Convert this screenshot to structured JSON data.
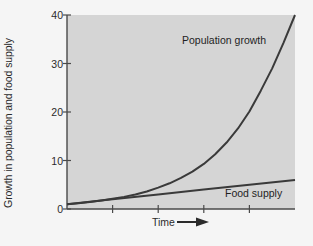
{
  "chart_data": {
    "type": "line",
    "title": "",
    "xlabel": "Time",
    "ylabel": "Growth in population and food supply",
    "xlabel_arrow": "➤",
    "ylim": [
      0,
      40
    ],
    "xlim": [
      0,
      5
    ],
    "yticks": [
      0,
      10,
      20,
      30,
      40
    ],
    "ytick_labels": [
      "0",
      "10",
      "20",
      "30",
      "40"
    ],
    "xticks": [
      1,
      2,
      3,
      4
    ],
    "xtick_labels": [
      "",
      "",
      "",
      ""
    ],
    "grid": false,
    "legend_position": "inline-annotations",
    "plot_background": "#d5d5d5",
    "figure_background": "#f5f5f5",
    "line_color": "#3a3a3a",
    "axis_color": "#4a4a4a",
    "series": [
      {
        "name": "Population growth",
        "annotation": "Population growth",
        "x": [
          0,
          0.25,
          0.5,
          0.75,
          1,
          1.25,
          1.5,
          1.75,
          2,
          2.25,
          2.5,
          2.75,
          3,
          3.25,
          3.5,
          3.75,
          4,
          4.25,
          4.5,
          4.75,
          5
        ],
        "values": [
          1.0,
          1.2,
          1.45,
          1.75,
          2.1,
          2.5,
          3.0,
          3.6,
          4.4,
          5.3,
          6.4,
          7.7,
          9.3,
          11.3,
          13.7,
          16.6,
          20.1,
          24.4,
          29.0,
          34.3,
          40.0
        ]
      },
      {
        "name": "Food supply",
        "annotation": "Food supply",
        "x": [
          0,
          1,
          2,
          3,
          4,
          5
        ],
        "values": [
          1.0,
          2.0,
          3.0,
          4.0,
          5.0,
          6.0
        ]
      }
    ],
    "annotations": [
      {
        "text": "Population growth",
        "x_px": 182,
        "y_px": 34
      },
      {
        "text": "Food supply",
        "x_px": 225,
        "y_px": 187
      }
    ]
  }
}
